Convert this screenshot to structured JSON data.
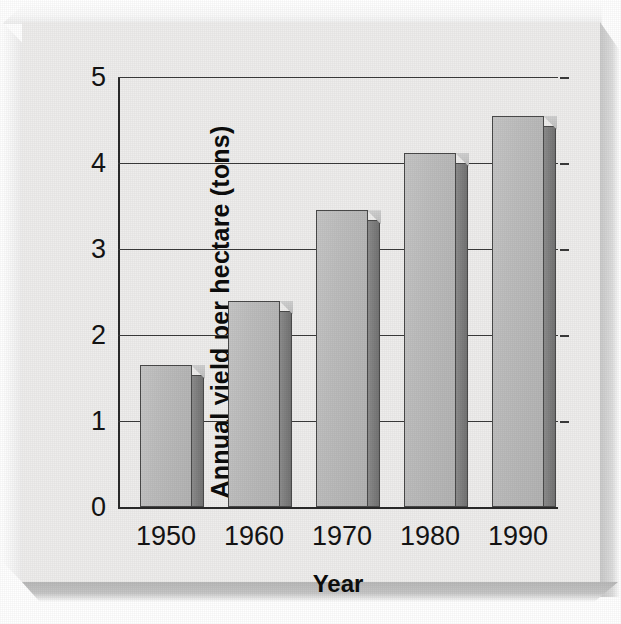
{
  "figure": {
    "background_color": "#ffffff",
    "panel_color": "#eeedec",
    "axis_color": "#2a2a2a",
    "bar_front_color": "#bdbdbd",
    "bar_side_color": "#7d7d7d"
  },
  "chart_data": {
    "type": "bar",
    "title": "",
    "xlabel": "Year",
    "ylabel": "Annual yield per hectare (tons)",
    "categories": [
      "1950",
      "1960",
      "1970",
      "1980",
      "1990"
    ],
    "values": [
      1.65,
      2.4,
      3.45,
      4.12,
      4.55
    ],
    "ylim": [
      0,
      5
    ],
    "yticks": [
      "0",
      "1",
      "2",
      "3",
      "4",
      "5"
    ],
    "ytick_values": [
      0,
      1,
      2,
      3,
      4,
      5
    ],
    "grid": true,
    "grid_axis": "y",
    "legend": false,
    "style": "3d-bars-grayscale"
  }
}
